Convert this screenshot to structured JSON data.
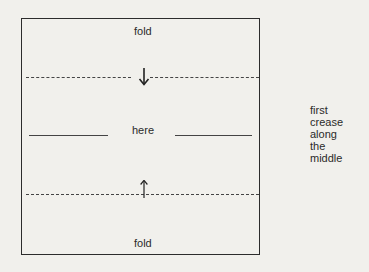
{
  "diagram": {
    "top_label": "fold",
    "middle_label": "here",
    "bottom_label": "fold",
    "side_note": [
      "first",
      "crease",
      "along",
      "the",
      "middle"
    ],
    "arrows": {
      "top": "down-arrow",
      "bottom": "up-arrow"
    }
  }
}
